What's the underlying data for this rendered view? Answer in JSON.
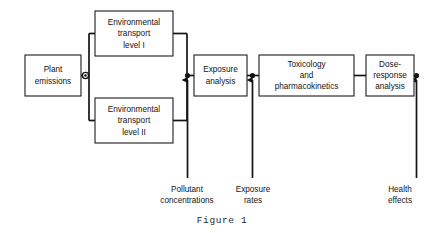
{
  "figure": {
    "caption": "Figure 1",
    "background_color": "#ffffff",
    "line_color": "#141414",
    "box_fill": "#ffffff"
  },
  "boxes": [
    {
      "id": "plant-emissions",
      "lines": [
        "Plant",
        "emissions"
      ],
      "x": 25,
      "y": 55,
      "w": 56,
      "h": 41
    },
    {
      "id": "environmental-transport-level-i",
      "lines": [
        "Environmental",
        "transport",
        "level I"
      ],
      "x": 95,
      "y": 11,
      "w": 78,
      "h": 45
    },
    {
      "id": "environmental-transport-level-ii",
      "lines": [
        "Environmental",
        "transport",
        "level II"
      ],
      "x": 95,
      "y": 98,
      "w": 78,
      "h": 45
    },
    {
      "id": "exposure-analysis",
      "lines": [
        "Exposure",
        "analysis"
      ],
      "x": 194,
      "y": 55,
      "w": 53,
      "h": 41
    },
    {
      "id": "toxicology-and-pharmacokinetics",
      "lines": [
        "Toxicology",
        "and",
        "pharmacokinetics"
      ],
      "x": 259,
      "y": 55,
      "w": 95,
      "h": 41
    },
    {
      "id": "dose-response-analysis",
      "lines": [
        "Dose-",
        "response",
        "analysis"
      ],
      "x": 366,
      "y": 55,
      "w": 48,
      "h": 41
    }
  ],
  "annotations": [
    {
      "id": "pollutant-concentrations",
      "lines": [
        "Pollutant",
        "concentrations"
      ],
      "x": 187,
      "y": 190
    },
    {
      "id": "exposure-rates",
      "lines": [
        "Exposure",
        "rates"
      ],
      "x": 252,
      "y": 190
    },
    {
      "id": "health-effects",
      "lines": [
        "Health",
        "effects"
      ],
      "x": 399,
      "y": 190
    }
  ]
}
